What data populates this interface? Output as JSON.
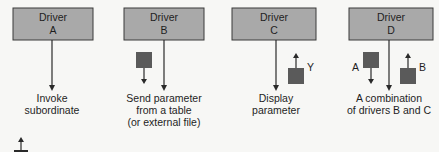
{
  "diagram": {
    "drivers": [
      {
        "title": "Driver",
        "letter": "A",
        "caption": [
          "Invoke",
          "subordinate"
        ]
      },
      {
        "title": "Driver",
        "letter": "B",
        "caption": [
          "Send parameter",
          "from a table",
          "(or external file)"
        ]
      },
      {
        "title": "Driver",
        "letter": "C",
        "param_label": "Y",
        "caption": [
          "Display",
          "parameter"
        ]
      },
      {
        "title": "Driver",
        "letter": "D",
        "param_labels": [
          "A",
          "B"
        ],
        "caption": [
          "A combination",
          "of drivers B and C"
        ]
      }
    ],
    "colors": {
      "box_fill": "#a9a9a9",
      "box_stroke": "#3a3a3a",
      "param_square": "#5a5a5a",
      "line": "#2a2a2a",
      "background": "#f7f7f5"
    }
  }
}
